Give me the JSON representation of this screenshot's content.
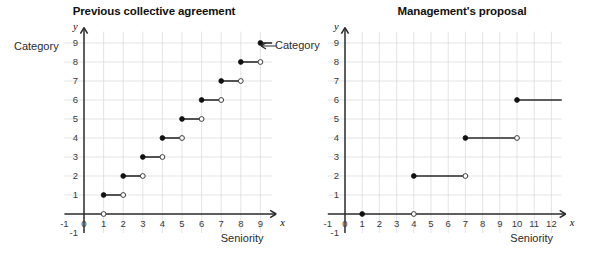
{
  "figure": {
    "ylabel_left_text": "Category",
    "ylabel_right_text": "Category"
  },
  "panels": [
    {
      "title": "Previous collective agreement",
      "xlabel": "Seniority",
      "ylabel": "Category",
      "x_axis_letter": "x",
      "y_axis_letter": "y",
      "xticks": [
        "-1",
        "0",
        "1",
        "2",
        "3",
        "4",
        "5",
        "6",
        "7",
        "8",
        "9"
      ],
      "yticks": [
        "-1",
        "1",
        "2",
        "3",
        "4",
        "5",
        "6",
        "7",
        "8",
        "9"
      ]
    },
    {
      "title": "Management's proposal",
      "xlabel": "Seniority",
      "ylabel": "Category",
      "x_axis_letter": "x",
      "y_axis_letter": "y",
      "xticks": [
        "-1",
        "0",
        "1",
        "2",
        "3",
        "4",
        "5",
        "6",
        "7",
        "8",
        "9",
        "10",
        "11",
        "12"
      ],
      "yticks": [
        "-1",
        "1",
        "2",
        "3",
        "4",
        "5",
        "6",
        "7",
        "8",
        "9"
      ]
    }
  ],
  "chart_data": [
    {
      "type": "line",
      "subtype": "step-function",
      "title": "Previous collective agreement",
      "xlabel": "Seniority",
      "ylabel": "Category",
      "xlim": [
        -1,
        9.6
      ],
      "ylim": [
        -1,
        9.6
      ],
      "grid": true,
      "legend": "none",
      "segments": [
        {
          "x_start": 1,
          "x_end": 2,
          "y": 1,
          "start_closed": true,
          "end_closed": false
        },
        {
          "x_start": 2,
          "x_end": 3,
          "y": 2,
          "start_closed": true,
          "end_closed": false
        },
        {
          "x_start": 3,
          "x_end": 4,
          "y": 3,
          "start_closed": true,
          "end_closed": false
        },
        {
          "x_start": 4,
          "x_end": 5,
          "y": 4,
          "start_closed": true,
          "end_closed": false
        },
        {
          "x_start": 5,
          "x_end": 6,
          "y": 5,
          "start_closed": true,
          "end_closed": false
        },
        {
          "x_start": 6,
          "x_end": 7,
          "y": 6,
          "start_closed": true,
          "end_closed": false
        },
        {
          "x_start": 7,
          "x_end": 8,
          "y": 7,
          "start_closed": true,
          "end_closed": false
        },
        {
          "x_start": 8,
          "x_end": 9,
          "y": 8,
          "start_closed": true,
          "end_closed": false
        },
        {
          "x_start": 9,
          "x_end": 9.6,
          "y": 9,
          "start_closed": true,
          "end_closed": false,
          "open_at_end": false
        }
      ],
      "extra_points": [
        {
          "x": 1,
          "y": 0,
          "closed": false
        }
      ]
    },
    {
      "type": "line",
      "subtype": "step-function",
      "title": "Management's proposal",
      "xlabel": "Seniority",
      "ylabel": "Category",
      "xlim": [
        -1,
        12.6
      ],
      "ylim": [
        -1,
        9.6
      ],
      "grid": true,
      "legend": "none",
      "segments": [
        {
          "x_start": 4,
          "x_end": 7,
          "y": 2,
          "start_closed": true,
          "end_closed": false
        },
        {
          "x_start": 7,
          "x_end": 10,
          "y": 4,
          "start_closed": true,
          "end_closed": false
        },
        {
          "x_start": 10,
          "x_end": 12.6,
          "y": 6,
          "start_closed": true,
          "end_closed": false,
          "open_at_end": false
        }
      ],
      "extra_points": [
        {
          "x": 1,
          "y": 0,
          "closed": true
        },
        {
          "x": 4,
          "y": 0,
          "closed": false
        }
      ]
    }
  ]
}
